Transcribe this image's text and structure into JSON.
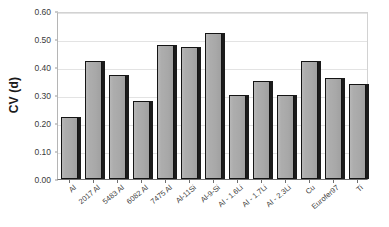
{
  "chart_data": {
    "type": "bar",
    "title": "",
    "xlabel": "",
    "ylabel": "CV (d)",
    "ylim": [
      0.0,
      0.6
    ],
    "grid": true,
    "legend": false,
    "categories": [
      "Al",
      "2017 Al",
      "5483 Al",
      "6082 Al",
      "7475 Al",
      "Al-11Si",
      "Al-9-Si",
      "Al - 1.6Li",
      "Al - 1.7Li",
      "Al - 2.3Li",
      "Cu",
      "Eurofer97",
      "Ti"
    ],
    "values": [
      0.22,
      0.42,
      0.37,
      0.28,
      0.48,
      0.47,
      0.52,
      0.3,
      0.35,
      0.3,
      0.42,
      0.36,
      0.34
    ],
    "ytick_labels": [
      "0.00",
      "0.10",
      "0.20",
      "0.30",
      "0.40",
      "0.50",
      "0.60"
    ],
    "ytick_values": [
      0.0,
      0.1,
      0.2,
      0.3,
      0.4,
      0.5,
      0.6
    ],
    "series": [
      {
        "name": "CV (d)",
        "values": [
          0.22,
          0.42,
          0.37,
          0.28,
          0.48,
          0.47,
          0.52,
          0.3,
          0.35,
          0.3,
          0.42,
          0.36,
          0.34
        ]
      }
    ],
    "colors": {
      "bar_fill": "#a9a9a9",
      "bar_border": "#141414",
      "bar_shadow": "#1b1b1b",
      "gridline": "#e3e3e3",
      "axis": "#6e6e6e",
      "text": "#3a3a3a",
      "background": "#ffffff"
    }
  }
}
